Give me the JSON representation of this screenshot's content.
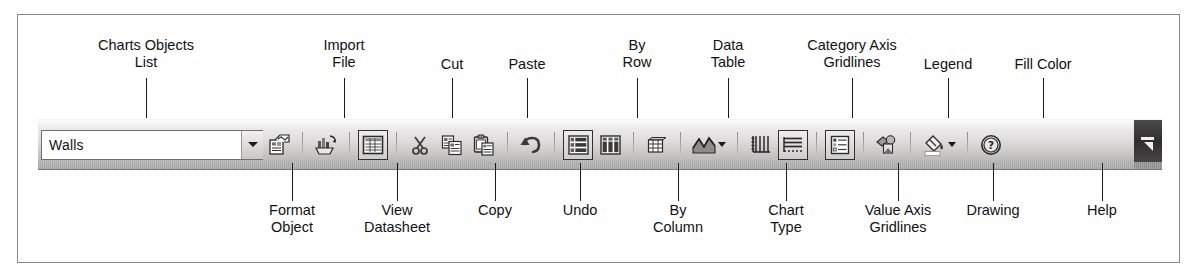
{
  "toolbar": {
    "combo": {
      "name": "Charts Objects List",
      "value": "Walls",
      "caret_icon": "chevron-down-icon"
    },
    "endcap": {
      "icon": "toolbar-options-icon"
    },
    "buttons": [
      {
        "id": "format-object",
        "label": "Format Object",
        "icon": "format-object-icon",
        "pressed": false,
        "has_dropdown": false
      },
      {
        "id": "import-file",
        "label": "Import File",
        "icon": "import-file-icon",
        "pressed": false,
        "has_dropdown": false
      },
      {
        "id": "view-datasheet",
        "label": "View Datasheet",
        "icon": "view-datasheet-icon",
        "pressed": true,
        "has_dropdown": false
      },
      {
        "id": "cut",
        "label": "Cut",
        "icon": "scissors-icon",
        "pressed": false,
        "has_dropdown": false
      },
      {
        "id": "copy",
        "label": "Copy",
        "icon": "copy-icon",
        "pressed": false,
        "has_dropdown": false
      },
      {
        "id": "paste",
        "label": "Paste",
        "icon": "paste-icon",
        "pressed": false,
        "has_dropdown": false
      },
      {
        "id": "undo",
        "label": "Undo",
        "icon": "undo-arrow-icon",
        "pressed": false,
        "has_dropdown": false
      },
      {
        "id": "by-row",
        "label": "By Row",
        "icon": "by-row-icon",
        "pressed": true,
        "has_dropdown": false
      },
      {
        "id": "by-column",
        "label": "By Column",
        "icon": "by-column-icon",
        "pressed": false,
        "has_dropdown": false
      },
      {
        "id": "data-table",
        "label": "Data Table",
        "icon": "data-table-icon",
        "pressed": false,
        "has_dropdown": false
      },
      {
        "id": "chart-type",
        "label": "Chart Type",
        "icon": "chart-type-icon",
        "pressed": false,
        "has_dropdown": true
      },
      {
        "id": "category-axis-gridlines",
        "label": "Category Axis Gridlines",
        "icon": "category-axis-gridlines-icon",
        "pressed": false,
        "has_dropdown": false
      },
      {
        "id": "value-axis-gridlines",
        "label": "Value Axis Gridlines",
        "icon": "value-axis-gridlines-icon",
        "pressed": true,
        "has_dropdown": false
      },
      {
        "id": "legend",
        "label": "Legend",
        "icon": "legend-icon",
        "pressed": true,
        "has_dropdown": false
      },
      {
        "id": "drawing",
        "label": "Drawing",
        "icon": "drawing-icon",
        "pressed": false,
        "has_dropdown": false
      },
      {
        "id": "fill-color",
        "label": "Fill Color",
        "icon": "fill-color-icon",
        "pressed": false,
        "has_dropdown": true
      },
      {
        "id": "help",
        "label": "Help",
        "icon": "help-question-icon",
        "pressed": false,
        "has_dropdown": false
      }
    ]
  },
  "callouts": {
    "above": [
      {
        "id": "charts-objects-list",
        "text": "Charts Objects\nList",
        "label_x": 146,
        "label_y": 37,
        "leader_x": 146,
        "leader_top": 78,
        "leader_height": 40
      },
      {
        "id": "import-file",
        "text": "Import\nFile",
        "label_x": 344,
        "label_y": 37,
        "leader_x": 344,
        "leader_top": 78,
        "leader_height": 40
      },
      {
        "id": "cut",
        "text": "Cut",
        "label_x": 452,
        "label_y": 56,
        "leader_x": 452,
        "leader_top": 78,
        "leader_height": 40
      },
      {
        "id": "paste",
        "text": "Paste",
        "label_x": 527,
        "label_y": 56,
        "leader_x": 527,
        "leader_top": 78,
        "leader_height": 40
      },
      {
        "id": "by-row",
        "text": "By\nRow",
        "label_x": 637,
        "label_y": 37,
        "leader_x": 637,
        "leader_top": 78,
        "leader_height": 40
      },
      {
        "id": "data-table",
        "text": "Data\nTable",
        "label_x": 728,
        "label_y": 37,
        "leader_x": 728,
        "leader_top": 78,
        "leader_height": 40
      },
      {
        "id": "category-axis-gridlines",
        "text": "Category Axis\nGridlines",
        "label_x": 852,
        "label_y": 37,
        "leader_x": 852,
        "leader_top": 78,
        "leader_height": 40
      },
      {
        "id": "legend",
        "text": "Legend",
        "label_x": 948,
        "label_y": 56,
        "leader_x": 948,
        "leader_top": 78,
        "leader_height": 40
      },
      {
        "id": "fill-color",
        "text": "Fill Color",
        "label_x": 1043,
        "label_y": 56,
        "leader_x": 1043,
        "leader_top": 78,
        "leader_height": 40
      }
    ],
    "below": [
      {
        "id": "format-object",
        "text": "Format\nObject",
        "label_x": 292,
        "label_y": 202,
        "leader_x": 292,
        "leader_top": 163,
        "leader_height": 38
      },
      {
        "id": "view-datasheet",
        "text": "View\nDatasheet",
        "label_x": 397,
        "label_y": 202,
        "leader_x": 397,
        "leader_top": 163,
        "leader_height": 38
      },
      {
        "id": "copy",
        "text": "Copy",
        "label_x": 495,
        "label_y": 202,
        "leader_x": 495,
        "leader_top": 163,
        "leader_height": 38
      },
      {
        "id": "undo",
        "text": "Undo",
        "label_x": 580,
        "label_y": 202,
        "leader_x": 580,
        "leader_top": 163,
        "leader_height": 38
      },
      {
        "id": "by-column",
        "text": "By\nColumn",
        "label_x": 678,
        "label_y": 202,
        "leader_x": 678,
        "leader_top": 163,
        "leader_height": 38
      },
      {
        "id": "chart-type",
        "text": "Chart\nType",
        "label_x": 786,
        "label_y": 202,
        "leader_x": 786,
        "leader_top": 163,
        "leader_height": 38
      },
      {
        "id": "value-axis-gridlines",
        "text": "Value Axis\nGridlines",
        "label_x": 898,
        "label_y": 202,
        "leader_x": 898,
        "leader_top": 163,
        "leader_height": 38
      },
      {
        "id": "drawing",
        "text": "Drawing",
        "label_x": 993,
        "label_y": 202,
        "leader_x": 993,
        "leader_top": 163,
        "leader_height": 38
      },
      {
        "id": "help",
        "text": "Help",
        "label_x": 1102,
        "label_y": 202,
        "leader_x": 1102,
        "leader_top": 163,
        "leader_height": 38
      }
    ]
  },
  "colors": {
    "ink": "#111111",
    "frame": "#8a8a8a",
    "toolbar_light": "#fbfbfb",
    "toolbar_dark": "#9d9a9a",
    "endcap": "#2f2d2d"
  }
}
